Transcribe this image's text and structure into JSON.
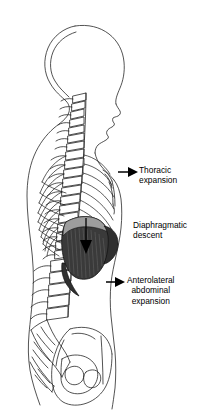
{
  "figure": {
    "background_color": "#ffffff",
    "line_color": "#1a1a1a",
    "diaphragm_fill": "#3a3a3a",
    "diaphragm_cap_fill": "#9a9a9a",
    "arrow_color": "#000000",
    "text_color": "#000000"
  },
  "annotations": {
    "thoracic": {
      "line1": "Thoracic",
      "line2": "expansion",
      "has_arrow": true
    },
    "diaphragmatic": {
      "line1": "Diaphragmatic",
      "line2": "descent",
      "has_arrow": false
    },
    "anterolateral": {
      "line1": "Anterolateral",
      "line2": "abdominal",
      "line3": "expansion",
      "has_arrow": true
    }
  },
  "anatomy": {
    "body_outline": "human torso and head in left lateral profile facing right",
    "skull": "cranium profile",
    "cervical_spine": "cervical vertebrae",
    "thoracic_spine": "thoracic vertebrae",
    "lumbar_spine": "lumbar vertebrae",
    "sacrum": "sacrum and coccyx",
    "pelvis": "pelvic girdle with ilium and obturator foramen",
    "ribcage": "rib cage",
    "sternum": "sternum",
    "diaphragm": "diaphragm dome shaded dark",
    "diaphragm_arrow": "downward arrow indicating diaphragmatic descent"
  }
}
